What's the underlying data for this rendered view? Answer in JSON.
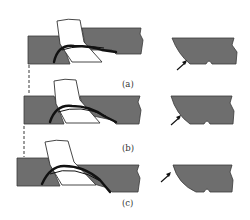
{
  "figure": {
    "panels": [
      {
        "id": "a",
        "label": "(a)"
      },
      {
        "id": "b",
        "label": "(b)"
      },
      {
        "id": "c",
        "label": "(c)"
      }
    ]
  },
  "colors": {
    "workpiece": "#6e6e6e",
    "tool": "#ffffff",
    "chip": "#111111",
    "background": "#ffffff"
  }
}
